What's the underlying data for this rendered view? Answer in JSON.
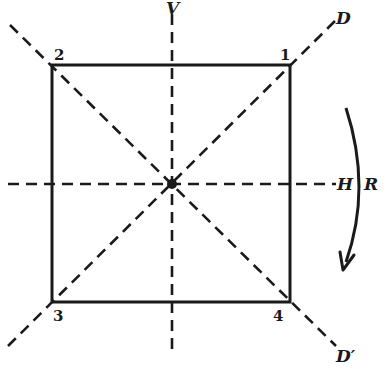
{
  "diagram": {
    "type": "square-symmetry-axes",
    "colors": {
      "stroke": "#1a1a1a",
      "background": "#ffffff"
    },
    "square": {
      "vertices": [
        {
          "label": "1",
          "position": "top-right"
        },
        {
          "label": "2",
          "position": "top-left"
        },
        {
          "label": "3",
          "position": "bottom-left"
        },
        {
          "label": "4",
          "position": "bottom-right"
        }
      ]
    },
    "axes": {
      "vertical": {
        "label": "V"
      },
      "horizontal": {
        "label": "H"
      },
      "diagonal": {
        "label": "D"
      },
      "anti_diagonal": {
        "label": "D′"
      }
    },
    "rotation": {
      "label": "R",
      "direction": "clockwise"
    },
    "center": {
      "marker": "dot"
    }
  }
}
